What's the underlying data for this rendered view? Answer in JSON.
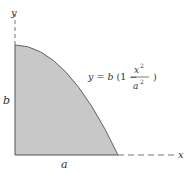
{
  "diagram": {
    "type": "area-under-parabola",
    "axes": {
      "x_label": "x",
      "y_label": "y"
    },
    "dimensions": {
      "width_label": "a",
      "height_label": "b"
    },
    "equation": {
      "lhs": "y = b (1 −",
      "numerator": "x",
      "numerator_exp": "2",
      "denominator": "a",
      "denominator_exp": "2",
      "close": ")"
    },
    "colors": {
      "fill": "#c8c8c8",
      "stroke": "#555555",
      "text": "#333333"
    }
  }
}
